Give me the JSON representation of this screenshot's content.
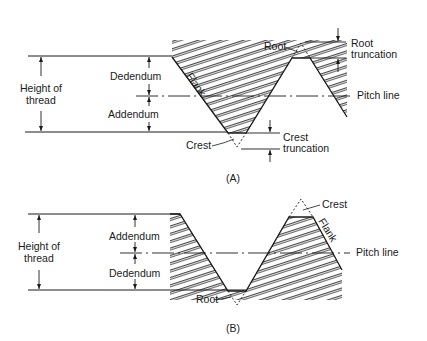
{
  "figure_a": {
    "caption": "(A)",
    "labels": {
      "height_of_thread_line1": "Height of",
      "height_of_thread_line2": "thread",
      "dedendum": "Dedendum",
      "addendum": "Addendum",
      "flank": "Flank",
      "root": "Root",
      "root_truncation_line1": "Root",
      "root_truncation_line2": "truncation",
      "pitch_line": "Pitch line",
      "crest": "Crest",
      "crest_truncation_line1": "Crest",
      "crest_truncation_line2": "truncation"
    }
  },
  "figure_b": {
    "caption": "(B)",
    "labels": {
      "height_of_thread_line1": "Height of",
      "height_of_thread_line2": "thread",
      "addendum": "Addendum",
      "dedendum": "Dedendum",
      "crest": "Crest",
      "flank": "Flank",
      "pitch_line": "Pitch line",
      "root": "Root"
    }
  },
  "colors": {
    "ink": "#1a1a1a",
    "background": "#ffffff"
  }
}
